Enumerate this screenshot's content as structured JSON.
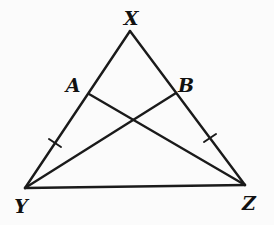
{
  "diagram": {
    "type": "geometry-triangle",
    "points": {
      "X": {
        "label": "X",
        "x": 130,
        "y": 31,
        "lx": 131,
        "ly": 25
      },
      "Y": {
        "label": "Y",
        "x": 25,
        "y": 188,
        "lx": 21,
        "ly": 213
      },
      "Z": {
        "label": "Z",
        "x": 245,
        "y": 185,
        "lx": 249,
        "ly": 210
      },
      "A": {
        "label": "A",
        "x": 89,
        "y": 94,
        "lx": 73,
        "ly": 92
      },
      "B": {
        "label": "B",
        "x": 176,
        "y": 93,
        "lx": 186,
        "ly": 92
      }
    },
    "segments": [
      {
        "name": "XY",
        "from": "X",
        "to": "Y"
      },
      {
        "name": "XZ",
        "from": "X",
        "to": "Z"
      },
      {
        "name": "YZ",
        "from": "Y",
        "to": "Z"
      },
      {
        "name": "AZ",
        "from": "A",
        "to": "Z"
      },
      {
        "name": "BY",
        "from": "B",
        "to": "Y"
      }
    ],
    "tick_marks": [
      {
        "on": "AY",
        "x1": 49,
        "y1": 139,
        "x2": 61,
        "y2": 147
      },
      {
        "on": "BZ",
        "x1": 204,
        "y1": 142,
        "x2": 216,
        "y2": 134
      }
    ],
    "colors": {
      "stroke": "#1a1a1a",
      "background": "#fbfbfb"
    }
  }
}
